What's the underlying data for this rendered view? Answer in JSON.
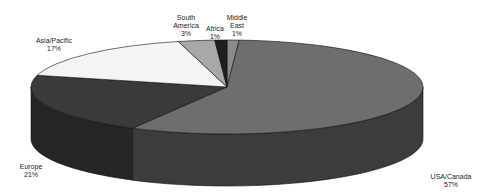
{
  "chart_data": {
    "type": "pie",
    "title": "",
    "style": "3d-exploded-none",
    "slices": [
      {
        "label": "USA/Canada",
        "value": 57,
        "pct_label": "57%",
        "color": "#6e6e6e",
        "side": "#3c3c3c"
      },
      {
        "label": "Europe",
        "value": 21,
        "pct_label": "21%",
        "color": "#3a3a3a",
        "side": "#262626"
      },
      {
        "label": "Asia/Pacific",
        "value": 17,
        "pct_label": "17%",
        "color": "#f4f4f4",
        "side": "#d8d8d8"
      },
      {
        "label": "South America",
        "value": 3,
        "pct_label": "3%",
        "color": "#a8a8a8",
        "side": "#808080"
      },
      {
        "label": "Africa",
        "value": 1,
        "pct_label": "1%",
        "color": "#1e1e1e",
        "side": "#141414"
      },
      {
        "label": "Middle East",
        "value": 1,
        "pct_label": "1%",
        "color": "#8a8a8a",
        "side": "#5a5a5a"
      }
    ],
    "legend": "none",
    "labels": [
      {
        "key": "usa",
        "name": "USA/Canada",
        "pct": "57%"
      },
      {
        "key": "europe",
        "name": "Europe",
        "pct": "21%"
      },
      {
        "key": "asia",
        "name": "Asia/Pacific",
        "pct": "17%"
      },
      {
        "key": "samerica_1",
        "name": "South",
        "name2": "America",
        "pct": "3%"
      },
      {
        "key": "africa",
        "name": "Africa",
        "pct": "1%"
      },
      {
        "key": "mideast_1",
        "name": "Middle",
        "name2": "East",
        "pct": "1%"
      }
    ]
  }
}
